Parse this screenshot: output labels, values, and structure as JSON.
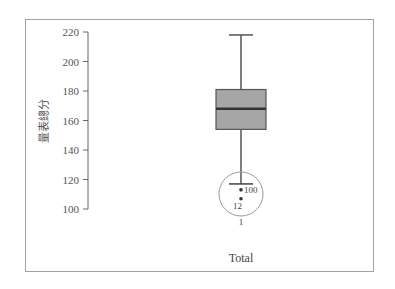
{
  "chart_data": {
    "type": "boxplot",
    "title": "",
    "xlabel": "Total",
    "ylabel": "量表總分",
    "yticks": [
      100,
      120,
      140,
      160,
      180,
      200,
      220
    ],
    "ylim": [
      100,
      220
    ],
    "categories": [
      "Total"
    ],
    "boxes": [
      {
        "name": "Total",
        "whisker_low": 117,
        "q1": 154,
        "median": 168,
        "q3": 181,
        "whisker_high": 218,
        "outliers": [
          {
            "label": "100",
            "value": 113
          },
          {
            "label": "12",
            "value": 107
          }
        ],
        "annotation_circle_label": "1"
      }
    ],
    "grid": false,
    "box_color": "#a6a6a6"
  }
}
